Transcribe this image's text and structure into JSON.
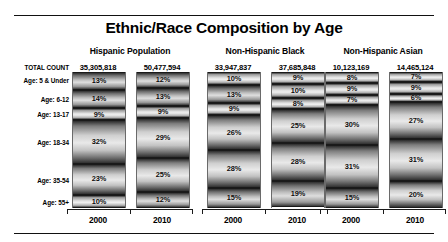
{
  "chart_data": {
    "type": "bar",
    "title": "Ethnic/Race Composition by Age",
    "xlabel": "",
    "ylabel": "",
    "ylim": [
      0,
      100
    ],
    "grid": false,
    "legend": "none",
    "note": "100% stacked bars; each group shows Census years 2000 and 2010",
    "categories": [
      "Age: 5 & Under",
      "Age: 6-12",
      "Age: 13-17",
      "Age: 18-34",
      "Age: 35-54",
      "Age: 55+"
    ],
    "groups": [
      {
        "name": "Hispanic Population",
        "bars": [
          {
            "year": "2000",
            "total_count": "35,305,818",
            "values": [
              13,
              14,
              9,
              32,
              23,
              10
            ],
            "labels": [
              "13%",
              "14%",
              "9%",
              "32%",
              "23%",
              "10%"
            ]
          },
          {
            "year": "2010",
            "total_count": "50,477,594",
            "values": [
              12,
              13,
              9,
              29,
              25,
              12
            ],
            "labels": [
              "12%",
              "13%",
              "9%",
              "29%",
              "25%",
              "12%"
            ]
          }
        ]
      },
      {
        "name": "Non-Hispanic Black",
        "bars": [
          {
            "year": "2000",
            "total_count": "33,947,837",
            "values": [
              10,
              13,
              9,
              26,
              28,
              15
            ],
            "labels": [
              "10%",
              "13%",
              "9%",
              "26%",
              "28%",
              "15%"
            ]
          },
          {
            "year": "2010",
            "total_count": "37,685,848",
            "values": [
              9,
              10,
              8,
              25,
              28,
              19
            ],
            "labels": [
              "9%",
              "10%",
              "8%",
              "25%",
              "28%",
              "19%"
            ]
          }
        ]
      },
      {
        "name": "Non-Hispanic Asian",
        "bars": [
          {
            "year": "2000",
            "total_count": "10,123,169",
            "values": [
              8,
              9,
              7,
              30,
              31,
              15
            ],
            "labels": [
              "8%",
              "9%",
              "7%",
              "30%",
              "31%",
              "15%"
            ]
          },
          {
            "year": "2010",
            "total_count": "14,465,124",
            "values": [
              7,
              9,
              6,
              27,
              31,
              20
            ],
            "labels": [
              "7%",
              "9%",
              "6%",
              "27%",
              "31%",
              "20%"
            ]
          }
        ]
      }
    ]
  },
  "row_labels": {
    "total": "TOTAL COUNT",
    "age_5_under": "Age: 5 & Under",
    "age_6_12": "Age: 6-12",
    "age_13_17": "Age: 13-17",
    "age_18_34": "Age: 18-34",
    "age_35_54": "Age: 35-54",
    "age_55_plus": "Age: 55+"
  },
  "colors": {
    "text": "#000000",
    "rule": "#111111",
    "bar_dark": "#2e2e2e",
    "bar_light": "#e9e9e9"
  }
}
